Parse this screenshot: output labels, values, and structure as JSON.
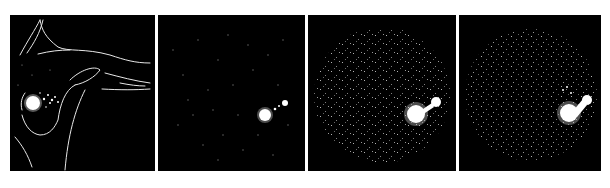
{
  "figure": {
    "background": "#ffffff",
    "panel_color": "#000000",
    "foreground": "#ffffff",
    "panels": [
      {
        "id": "panel-1",
        "description": "Line-drawing outline of a reclining body with bright hotspot",
        "x": 10,
        "w": 145,
        "hotspot": {
          "cx": 23,
          "cy": 88,
          "r": 7
        },
        "secondary": {
          "cx": 40,
          "cy": 82,
          "r": 4
        },
        "noise": "sparse"
      },
      {
        "id": "panel-2",
        "description": "Sparse scatter with bright hotspot at lower right",
        "x": 158,
        "w": 147,
        "hotspot": {
          "cx": 107,
          "cy": 100,
          "r": 6
        },
        "secondary": {
          "cx": 127,
          "cy": 88,
          "r": 3
        },
        "noise": "sparse"
      },
      {
        "id": "panel-3",
        "description": "Dense circular scatter with bright hotspot at lower right",
        "x": 308,
        "w": 148,
        "hotspot": {
          "cx": 108,
          "cy": 99,
          "r": 9
        },
        "secondary": {
          "cx": 128,
          "cy": 87,
          "r": 5
        },
        "noise": "dense"
      },
      {
        "id": "panel-4",
        "description": "Dense circular scatter with bright hotspot at lower right",
        "x": 459,
        "w": 142,
        "hotspot": {
          "cx": 110,
          "cy": 98,
          "r": 9
        },
        "secondary": {
          "cx": 128,
          "cy": 85,
          "r": 5
        },
        "noise": "dense"
      }
    ]
  }
}
